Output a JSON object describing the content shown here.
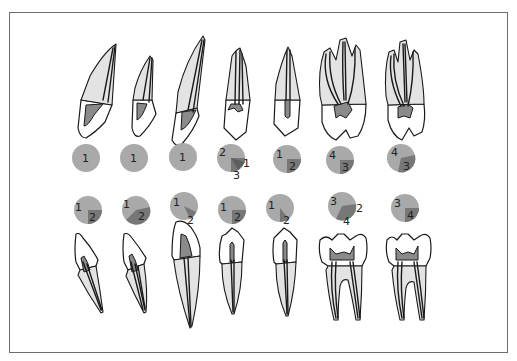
{
  "figure": {
    "colors": {
      "frame": "#6e6e6e",
      "outline": "#1a1a1a",
      "root": "#e3e3e3",
      "pulp": "#8a8a8a",
      "circle_light": "#a9a9a9",
      "circle_dark": "#777777",
      "background": "#ffffff"
    }
  },
  "upper_row": {
    "teeth": [
      {
        "id": "upper-central-incisor",
        "circle": {
          "labels": [
            "1"
          ]
        }
      },
      {
        "id": "upper-lateral-incisor",
        "circle": {
          "labels": [
            "1"
          ]
        }
      },
      {
        "id": "upper-canine",
        "circle": {
          "labels": [
            "1"
          ]
        }
      },
      {
        "id": "upper-first-premolar",
        "circle": {
          "labels": [
            "2",
            "1",
            "3"
          ]
        }
      },
      {
        "id": "upper-second-premolar",
        "circle": {
          "labels": [
            "1",
            "2"
          ]
        }
      },
      {
        "id": "upper-first-molar",
        "circle": {
          "labels": [
            "4",
            "3"
          ]
        }
      },
      {
        "id": "upper-second-molar",
        "circle": {
          "labels": [
            "4",
            "3"
          ]
        }
      }
    ]
  },
  "lower_row": {
    "teeth": [
      {
        "id": "lower-central-incisor",
        "circle": {
          "labels": [
            "1",
            "2"
          ]
        }
      },
      {
        "id": "lower-lateral-incisor",
        "circle": {
          "labels": [
            "1",
            "2"
          ]
        }
      },
      {
        "id": "lower-canine",
        "circle": {
          "labels": [
            "1",
            "2"
          ]
        }
      },
      {
        "id": "lower-first-premolar",
        "circle": {
          "labels": [
            "1",
            "2"
          ]
        }
      },
      {
        "id": "lower-second-premolar",
        "circle": {
          "labels": [
            "1",
            "2"
          ]
        }
      },
      {
        "id": "lower-first-molar",
        "circle": {
          "labels": [
            "3",
            "2",
            "4"
          ]
        }
      },
      {
        "id": "lower-second-molar",
        "circle": {
          "labels": [
            "3",
            "4"
          ]
        }
      }
    ]
  }
}
